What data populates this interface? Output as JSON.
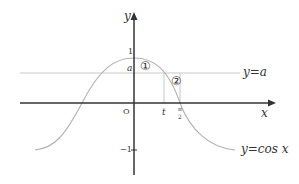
{
  "diagram": {
    "type": "function-graph",
    "axes": {
      "x_label": "x",
      "y_label": "y",
      "origin_label": "O"
    },
    "y_ticks": {
      "one": "1",
      "a": "a",
      "minus_one": "−1"
    },
    "x_ticks": {
      "t": "t",
      "half_pi_num": "π",
      "half_pi_den": "2"
    },
    "curves": {
      "cos_label": "y=cos x",
      "line_label": "y=a"
    },
    "regions": {
      "region1": "①",
      "region2": "②"
    },
    "colors": {
      "axis": "#333333",
      "curve": "#b0b0b0",
      "line": "#c8c8c8",
      "text": "#333333"
    }
  }
}
